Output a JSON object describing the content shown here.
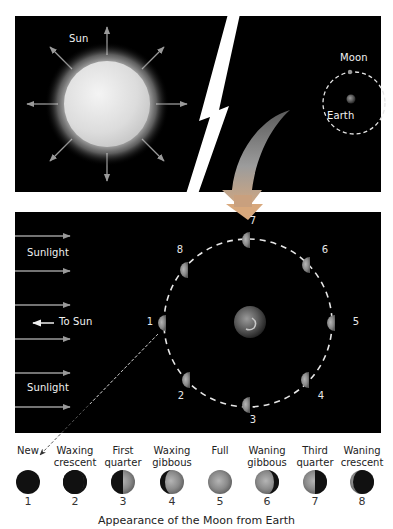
{
  "top_panel": {
    "sun_label": "Sun",
    "moon_label": "Moon",
    "earth_label": "Earth"
  },
  "orbit_panel": {
    "sunlight_label_top": "Sunlight",
    "sunlight_label_bottom": "Sunlight",
    "to_sun_label": "To Sun",
    "position_numbers": [
      "1",
      "2",
      "3",
      "4",
      "5",
      "6",
      "7",
      "8"
    ]
  },
  "phases": [
    {
      "name_line1": "",
      "name_line2": "New",
      "number": "1",
      "type": "new"
    },
    {
      "name_line1": "Waxing",
      "name_line2": "crescent",
      "number": "2",
      "type": "waxing-crescent"
    },
    {
      "name_line1": "First",
      "name_line2": "quarter",
      "number": "3",
      "type": "first-quarter"
    },
    {
      "name_line1": "Waxing",
      "name_line2": "gibbous",
      "number": "4",
      "type": "waxing-gibbous"
    },
    {
      "name_line1": "",
      "name_line2": "Full",
      "number": "5",
      "type": "full"
    },
    {
      "name_line1": "Waning",
      "name_line2": "gibbous",
      "number": "6",
      "type": "waning-gibbous"
    },
    {
      "name_line1": "Third",
      "name_line2": "quarter",
      "number": "7",
      "type": "third-quarter"
    },
    {
      "name_line1": "Waning",
      "name_line2": "crescent",
      "number": "8",
      "type": "waning-crescent"
    }
  ],
  "caption": "Appearance of the Moon from Earth",
  "colors": {
    "panel_bg": "#000000",
    "label": "#f2f2f2",
    "arrow_gray": "#9a9a9a",
    "curved_arrow_tip": "#d9a97a"
  }
}
